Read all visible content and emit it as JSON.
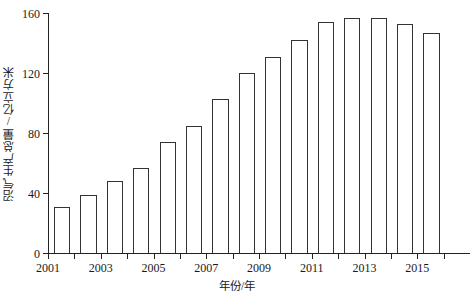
{
  "chart_data": {
    "type": "bar",
    "title": "",
    "xlabel": "年份/年",
    "ylabel": "沼气生产总量/亿立方米",
    "categories": [
      "2001",
      "2002",
      "2003",
      "2004",
      "2005",
      "2006",
      "2007",
      "2008",
      "2009",
      "2010",
      "2011",
      "2012",
      "2013",
      "2014",
      "2015"
    ],
    "values": [
      31,
      39,
      48,
      57,
      74,
      85,
      103,
      120,
      131,
      142,
      154,
      157,
      157,
      153,
      147
    ],
    "xtick_labels_shown": [
      "2001",
      "2003",
      "2005",
      "2007",
      "2009",
      "2011",
      "2013",
      "2015"
    ],
    "ytick_labels": [
      "0",
      "40",
      "80",
      "120",
      "160"
    ],
    "ytick_values": [
      0,
      40,
      80,
      120,
      160
    ],
    "ylim": [
      0,
      160
    ],
    "grid": false,
    "legend": null,
    "bar_fill_color": "#ffffff",
    "bar_edge_color": "#333333",
    "axis_color": "#222222",
    "background_color": "#ffffff"
  }
}
